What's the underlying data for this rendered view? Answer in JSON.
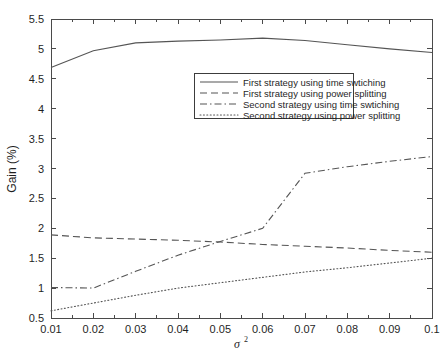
{
  "chart_data": {
    "type": "line",
    "title": "",
    "xlabel": "σ²",
    "ylabel": "Gain (%)",
    "xlim": [
      0.01,
      0.1
    ],
    "ylim": [
      0.5,
      5.5
    ],
    "grid": false,
    "legend_position": "upper-center",
    "x": [
      0.01,
      0.02,
      0.03,
      0.04,
      0.05,
      0.06,
      0.07,
      0.08,
      0.09,
      0.1
    ],
    "xticklabels": [
      "0.01",
      "0.02",
      "0.03",
      "0.04",
      "0.05",
      "0.06",
      "0.07",
      "0.08",
      "0.09",
      "0.1"
    ],
    "yticklabels": [
      "0.5",
      "1",
      "1.5",
      "2",
      "2.5",
      "3",
      "3.5",
      "4",
      "4.5",
      "5",
      "5.5"
    ],
    "yticks": [
      0.5,
      1,
      1.5,
      2,
      2.5,
      3,
      3.5,
      4,
      4.5,
      5,
      5.5
    ],
    "series": [
      {
        "name": "First strategy using time swtiching",
        "style": "solid",
        "values": [
          4.69,
          4.97,
          5.1,
          5.13,
          5.15,
          5.18,
          5.14,
          5.07,
          5.0,
          4.94
        ]
      },
      {
        "name": "First strategy using power splitting",
        "style": "dashed",
        "values": [
          1.89,
          1.84,
          1.82,
          1.8,
          1.77,
          1.73,
          1.7,
          1.67,
          1.63,
          1.6
        ]
      },
      {
        "name": "Second strategy using time swtiching",
        "style": "dashdot",
        "values": [
          1.01,
          1.0,
          1.28,
          1.55,
          1.78,
          2.0,
          2.92,
          3.03,
          3.12,
          3.2
        ]
      },
      {
        "name": "Second strategy using power splitting",
        "style": "dotted",
        "values": [
          0.62,
          0.75,
          0.88,
          1.0,
          1.09,
          1.18,
          1.27,
          1.34,
          1.42,
          1.5
        ]
      }
    ]
  },
  "legend": {
    "entries": [
      "First strategy using time swtiching",
      "First strategy using power splitting",
      "Second strategy using time swtiching",
      "Second strategy using power splitting"
    ]
  },
  "axes": {
    "y_label": "Gain (%)",
    "x_label_base": "σ",
    "x_label_exp": "2"
  }
}
